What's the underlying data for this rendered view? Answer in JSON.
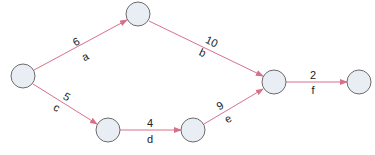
{
  "diagram": {
    "type": "network-activity-graph",
    "colors": {
      "edge": "#d9708a",
      "node_fill": "#e8eef4",
      "node_stroke": "#6b6b6b",
      "text": "#222222"
    },
    "nodes": [
      {
        "id": "n1",
        "cx": 23,
        "cy": 76
      },
      {
        "id": "n2",
        "cx": 138,
        "cy": 14
      },
      {
        "id": "n3",
        "cx": 274,
        "cy": 82
      },
      {
        "id": "n4",
        "cx": 359,
        "cy": 82
      },
      {
        "id": "n5",
        "cx": 108,
        "cy": 130
      },
      {
        "id": "n6",
        "cx": 193,
        "cy": 130
      }
    ],
    "edges": [
      {
        "from": "n1",
        "to": "n2",
        "duration": "6",
        "activity": "a"
      },
      {
        "from": "n2",
        "to": "n3",
        "duration": "10",
        "activity": "b"
      },
      {
        "from": "n1",
        "to": "n5",
        "duration": "5",
        "activity": "c"
      },
      {
        "from": "n5",
        "to": "n6",
        "duration": "4",
        "activity": "d"
      },
      {
        "from": "n6",
        "to": "n3",
        "duration": "9",
        "activity": "e"
      },
      {
        "from": "n3",
        "to": "n4",
        "duration": "2",
        "activity": "f"
      }
    ]
  }
}
